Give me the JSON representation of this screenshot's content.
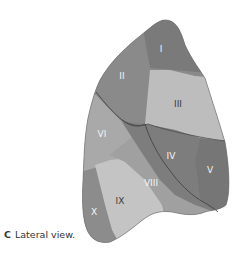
{
  "figure": {
    "panel_letter": "C",
    "caption": "Lateral view.",
    "segments": [
      {
        "id": "I",
        "label": "I",
        "color": "#7a7a7a"
      },
      {
        "id": "II",
        "label": "II",
        "color": "#8a8a8a"
      },
      {
        "id": "III",
        "label": "III",
        "color": "#bdbdbd"
      },
      {
        "id": "IV",
        "label": "IV",
        "color": "#7d7d7d"
      },
      {
        "id": "V",
        "label": "V",
        "color": "#767676"
      },
      {
        "id": "VI",
        "label": "VI",
        "color": "#a9a9a9"
      },
      {
        "id": "VIII",
        "label": "VIII",
        "color": "#a0a0a0"
      },
      {
        "id": "IX",
        "label": "IX",
        "color": "#c4c4c4"
      },
      {
        "id": "X",
        "label": "X",
        "color": "#8c8c8c"
      }
    ],
    "fissure_color": "#4a4a4a"
  }
}
